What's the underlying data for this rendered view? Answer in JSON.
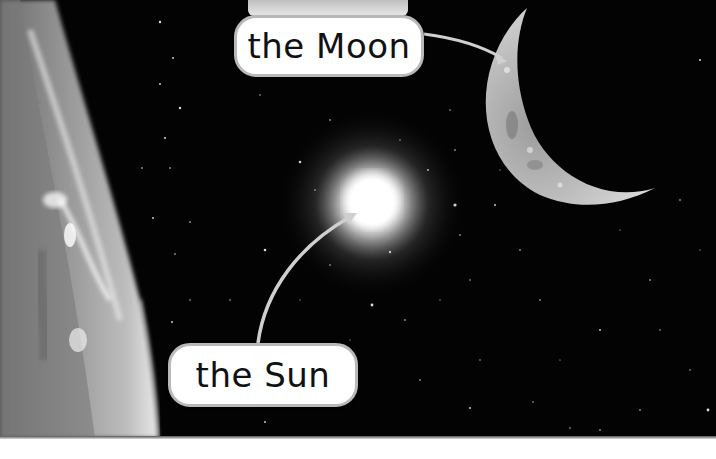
{
  "scene": {
    "description": "Space scene showing Earth's limb, the Sun with glowing halo, and a crescent Moon with callout labels",
    "background_color": "#030303"
  },
  "labels": {
    "moon": {
      "text": "the Moon",
      "target": "crescent-moon"
    },
    "sun": {
      "text": "the Sun",
      "target": "sun"
    }
  },
  "objects": [
    {
      "name": "earth",
      "position": "left edge",
      "appearance": "grey clouded planet limb"
    },
    {
      "name": "sun",
      "position": "center",
      "appearance": "bright white glowing disc"
    },
    {
      "name": "moon",
      "position": "top right",
      "appearance": "thin grey crescent"
    }
  ],
  "colors": {
    "label_fill": "#ffffff",
    "label_border": "#b9b9b9",
    "arrow": "#cfcfcf",
    "text": "#111111"
  }
}
